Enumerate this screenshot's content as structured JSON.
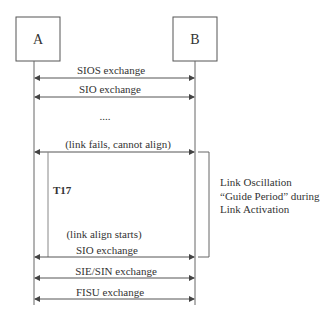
{
  "diagram": {
    "type": "sequence",
    "participants": [
      {
        "id": "A",
        "label": "A"
      },
      {
        "id": "B",
        "label": "B"
      }
    ],
    "messages": [
      {
        "label": "SIOS exchange",
        "direction": "bidirectional"
      },
      {
        "label": "SIO exchange",
        "direction": "bidirectional"
      },
      {
        "label": "....",
        "type": "ellipsis"
      },
      {
        "label": "(link fails, cannot align)",
        "direction": "bidirectional"
      },
      {
        "label": "(link align starts)",
        "type": "note"
      },
      {
        "label": "SIO exchange",
        "direction": "bidirectional"
      },
      {
        "label": "SIE/SIN exchange",
        "direction": "bidirectional"
      },
      {
        "label": "FISU exchange",
        "direction": "bidirectional"
      }
    ],
    "timer": {
      "label": "T17"
    },
    "annotation": {
      "lines": [
        "Link Oscillation",
        "“Guide Period” during",
        "Link Activation"
      ]
    },
    "colors": {
      "line": "#555555",
      "text": "#333333",
      "background": "#ffffff"
    }
  }
}
